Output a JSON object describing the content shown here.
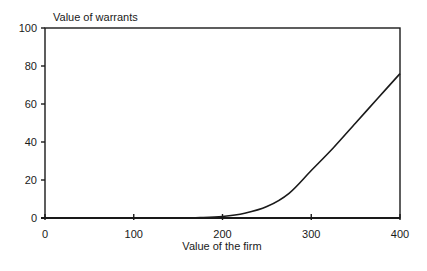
{
  "chart_data": {
    "type": "line",
    "title": "",
    "ylabel": "Value of warrants",
    "xlabel": "Value of the firm",
    "xlim": [
      0,
      400
    ],
    "ylim": [
      0,
      100
    ],
    "x_ticks": [
      0,
      100,
      200,
      300,
      400
    ],
    "y_ticks": [
      0,
      20,
      40,
      60,
      80,
      100
    ],
    "grid": false,
    "legend": null,
    "series": [
      {
        "name": "Value of warrants",
        "x": [
          0,
          50,
          100,
          150,
          175,
          200,
          225,
          250,
          275,
          300,
          325,
          350,
          375,
          400
        ],
        "values": [
          0,
          0,
          0,
          0,
          0.2,
          0.8,
          2.5,
          6,
          13,
          25,
          37,
          50,
          63,
          76
        ]
      }
    ]
  },
  "colors": {
    "line": "#1a1a1a",
    "axis": "#1a1a1a",
    "background": "#ffffff"
  }
}
